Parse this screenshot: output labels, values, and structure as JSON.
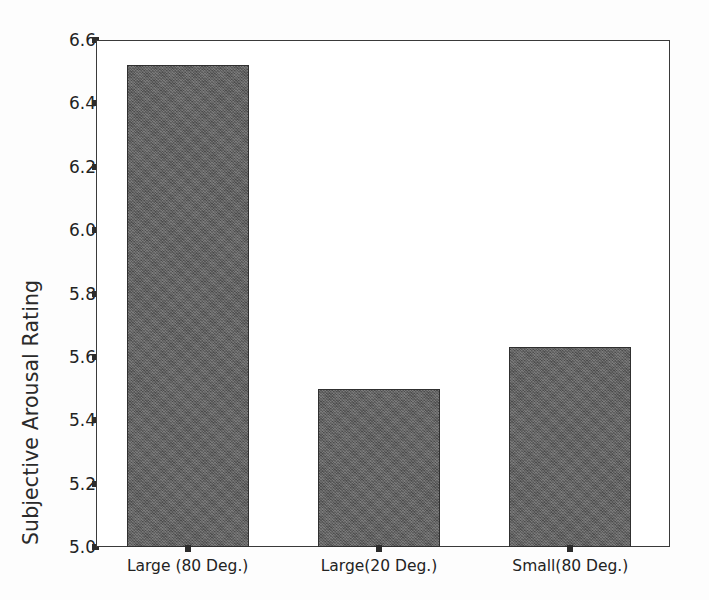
{
  "chart_data": {
    "type": "bar",
    "title": "",
    "subtitle": "",
    "xlabel": "",
    "ylabel": "Subjective Arousal Rating",
    "categories": [
      "Large (80 Deg.)",
      "Large(20 Deg.)",
      "Small(80 Deg.)"
    ],
    "values": [
      6.52,
      5.5,
      5.63
    ],
    "ylim": [
      5.0,
      6.6
    ],
    "ytick_labels": [
      "6.6",
      "6.4",
      "6.2",
      "6.0",
      "5.8",
      "5.6",
      "5.4",
      "5.2",
      "5.0"
    ],
    "ytick_values": [
      6.6,
      6.4,
      6.2,
      6.0,
      5.8,
      5.6,
      5.4,
      5.2,
      5.0
    ],
    "grid": false,
    "legend": null,
    "legend_position": "none",
    "bar_color": "#5d5d5d",
    "bar_edge_color": "#303030",
    "axis_color": "#3a3a3a",
    "background_color": "#fdfdfd",
    "annotations": []
  }
}
